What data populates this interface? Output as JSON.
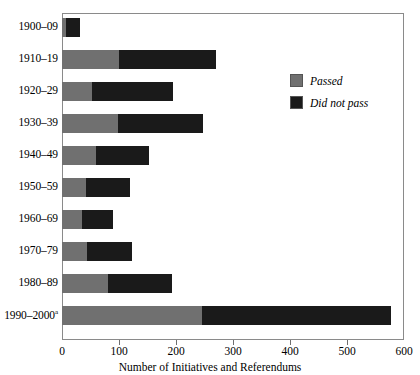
{
  "chart_data": {
    "type": "bar",
    "orientation": "horizontal",
    "stacked": true,
    "title": "",
    "xlabel": "Number of Initiatives and Referendums",
    "ylabel": "",
    "xlim": [
      0,
      600
    ],
    "xticks": [
      0,
      100,
      200,
      300,
      400,
      500,
      600
    ],
    "xtick_labels": [
      "0",
      "100",
      "200",
      "300",
      "400",
      "500",
      "600"
    ],
    "grid": false,
    "legend_position": "upper right",
    "categories": [
      "1900–09",
      "1910–19",
      "1920–29",
      "1930–39",
      "1940–49",
      "1950–59",
      "1960–69",
      "1970–79",
      "1980–89",
      "1990–2000"
    ],
    "category_footnote_marker": "a",
    "category_footnote_index": 9,
    "series": [
      {
        "name": "Passed",
        "color": "#707070",
        "values": [
          7,
          100,
          53,
          98,
          60,
          42,
          35,
          44,
          81,
          245
        ]
      },
      {
        "name": "Did not pass",
        "color": "#1a1a1a",
        "values": [
          24,
          170,
          142,
          149,
          93,
          77,
          54,
          79,
          112,
          333
        ]
      }
    ],
    "totals": [
      31,
      270,
      195,
      247,
      153,
      119,
      89,
      123,
      193,
      578
    ],
    "legend": [
      {
        "label": "Passed",
        "color": "#707070"
      },
      {
        "label": "Did not pass",
        "color": "#1a1a1a"
      }
    ]
  },
  "colors": {
    "passed": "#707070",
    "did_not_pass": "#1a1a1a",
    "frame": "#8a8a8a",
    "background": "#ffffff"
  }
}
